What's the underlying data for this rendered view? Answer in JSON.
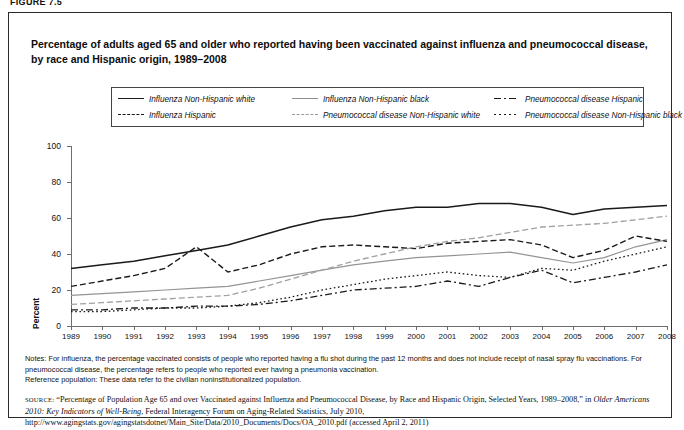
{
  "figure_label": "FIGURE 7.5",
  "title": "Percentage of adults aged 65 and older who reported having been vaccinated against influenza and pneumococcal disease, by race and Hispanic origin, 1989–2008",
  "legend": {
    "columns": [
      [
        {
          "label": "Influenza Non-Hispanic white",
          "style": "solid-dark"
        },
        {
          "label": "Influenza Hispanic",
          "style": "dash-dark"
        }
      ],
      [
        {
          "label": "Influenza Non-Hispanic black",
          "style": "solid-light"
        },
        {
          "label": "Pneumococcal disease Non-Hispanic white",
          "style": "dash-light"
        }
      ],
      [
        {
          "label": "Pneumococcal disease Hispanic",
          "style": "dash-dot"
        },
        {
          "label": "Pneumococcal disease Non-Hispanic black",
          "style": "dotted"
        }
      ]
    ]
  },
  "chart_data": {
    "type": "line",
    "title": "Percentage of adults aged 65 and older who reported having been vaccinated against influenza and pneumococcal disease, by race and Hispanic origin, 1989–2008",
    "xlabel": "",
    "ylabel": "Percent",
    "ylim": [
      0,
      100
    ],
    "yticks": [
      0,
      20,
      40,
      60,
      80,
      100
    ],
    "grid": false,
    "legend_position": "above-plot",
    "x": [
      1989,
      1990,
      1991,
      1992,
      1993,
      1994,
      1995,
      1996,
      1997,
      1998,
      1999,
      2000,
      2001,
      2002,
      2003,
      2004,
      2005,
      2006,
      2007,
      2008
    ],
    "series": [
      {
        "name": "Influenza Non-Hispanic white",
        "style": "solid-dark",
        "values": [
          32,
          34,
          36,
          39,
          42,
          45,
          50,
          55,
          59,
          61,
          64,
          66,
          66,
          68,
          68,
          66,
          62,
          65,
          66,
          67
        ]
      },
      {
        "name": "Influenza Non-Hispanic black",
        "style": "solid-light",
        "values": [
          17,
          18,
          19,
          20,
          21,
          22,
          25,
          28,
          31,
          34,
          36,
          38,
          39,
          40,
          41,
          38,
          35,
          38,
          44,
          48
        ]
      },
      {
        "name": "Influenza Hispanic",
        "style": "dash-dark",
        "values": [
          22,
          25,
          28,
          32,
          44,
          30,
          34,
          40,
          44,
          45,
          44,
          43,
          46,
          47,
          48,
          45,
          38,
          42,
          50,
          47
        ]
      },
      {
        "name": "Pneumococcal disease Non-Hispanic white",
        "style": "dash-light",
        "values": [
          12,
          13,
          14,
          15,
          16,
          17,
          21,
          26,
          31,
          36,
          40,
          44,
          47,
          49,
          52,
          55,
          56,
          57,
          59,
          61
        ]
      },
      {
        "name": "Pneumococcal disease Hispanic",
        "style": "dash-dot",
        "values": [
          9,
          9,
          10,
          10,
          11,
          11,
          12,
          14,
          17,
          20,
          21,
          22,
          25,
          22,
          27,
          31,
          24,
          27,
          30,
          34
        ]
      },
      {
        "name": "Pneumococcal disease Non-Hispanic black",
        "style": "dotted",
        "values": [
          8,
          8,
          9,
          10,
          10,
          11,
          13,
          16,
          20,
          23,
          26,
          28,
          30,
          28,
          27,
          32,
          31,
          36,
          40,
          44
        ]
      }
    ]
  },
  "axis": {
    "y_title": "Percent",
    "y_ticks": [
      "0",
      "20",
      "40",
      "60",
      "80",
      "100"
    ],
    "x_ticks": [
      "1989",
      "1990",
      "1991",
      "1992",
      "1993",
      "1994",
      "1995",
      "1996",
      "1997",
      "1998",
      "1999",
      "2000",
      "2001",
      "2002",
      "2003",
      "2004",
      "2005",
      "2006",
      "2007",
      "2008"
    ]
  },
  "notes": {
    "line1": "Notes: For influenza, the percentage vaccinated consists of people who reported having a flu shot during the past 12 months and does not include receipt of nasal spray flu vaccinations. For pneumococcal disease, the percentage refers to people who reported ever having a pneumonia vaccination.",
    "line2": "Reference population: These data refer to the civilian noninstitutionalized population."
  },
  "source": {
    "label": "SOURCE:",
    "quoted_title": "“Percentage of Population Age 65 and over Vaccinated against Influenza and Pneumococcal Disease, by Race and Hispanic Origin, Selected Years, 1989–2008,” in ",
    "publication": "Older Americans 2010: Key Indicators of Well-Being",
    "rest": ", Federal Interagency Forum on Aging-Related Statistics, July 2010, http://www.agingstats.gov/agingstatsdotnet/Main_Site/Data/2010_Documents/Docs/OA_2010.pdf (accessed April 2, 2011)"
  }
}
